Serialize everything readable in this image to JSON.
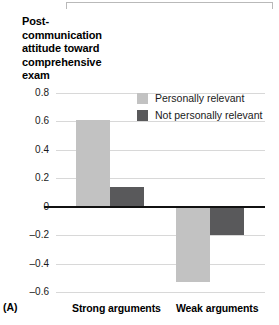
{
  "panel_label": "(A)",
  "legend": {
    "entries": [
      {
        "label": "Personally relevant",
        "color": "#c2c2c2"
      },
      {
        "label": "Not personally relevant",
        "color": "#59595b"
      }
    ]
  },
  "chart_data": {
    "type": "bar",
    "title": "",
    "ylabel": "Post-communication attitude toward comprehensive exam",
    "ylabel_lines": [
      "Post-",
      "communication",
      "attitude toward",
      "comprehensive",
      "exam"
    ],
    "xlabel": "",
    "categories": [
      "Strong arguments",
      "Weak arguments"
    ],
    "series": [
      {
        "name": "Personally relevant",
        "color": "#c2c2c2",
        "values": [
          0.61,
          -0.53
        ]
      },
      {
        "name": "Not personally relevant",
        "color": "#59595b",
        "values": [
          0.14,
          -0.2
        ]
      }
    ],
    "ylim": [
      -0.6,
      0.8
    ],
    "yticks": [
      0.8,
      0.6,
      0.4,
      0.2,
      0,
      -0.2,
      -0.4,
      -0.6
    ],
    "ytick_labels": [
      "0.8",
      "0.6",
      "0.4",
      "0.2",
      "0",
      "–0.2",
      "–0.4",
      "–0.6"
    ],
    "grid": true,
    "legend_position": "top-right",
    "zero_line": true
  }
}
